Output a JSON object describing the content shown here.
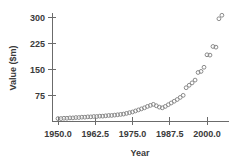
{
  "chart_data": {
    "type": "scatter",
    "title": "",
    "xlabel": "Year",
    "ylabel": "Value ($m)",
    "xlim": [
      1948.0,
      2007.5
    ],
    "ylim": [
      0,
      330
    ],
    "grid": false,
    "legend": null,
    "xticks": [
      "1950.0",
      "1962.5",
      "1975.0",
      "1987.5",
      "2000.0"
    ],
    "xtick_values": [
      1950.0,
      1962.5,
      1975.0,
      1987.5,
      2000.0
    ],
    "yticks": [
      "75",
      "150",
      "225",
      "300"
    ],
    "ytick_values": [
      75,
      150,
      225,
      300
    ],
    "marker": "open-circle",
    "marker_color": "#8a8a8a",
    "x": [
      1950,
      1951,
      1952,
      1953,
      1954,
      1955,
      1956,
      1957,
      1958,
      1959,
      1960,
      1961,
      1962,
      1963,
      1964,
      1965,
      1966,
      1967,
      1968,
      1969,
      1970,
      1971,
      1972,
      1973,
      1974,
      1975,
      1976,
      1977,
      1978,
      1979,
      1980,
      1981,
      1982,
      1983,
      1984,
      1985,
      1986,
      1987,
      1988,
      1989,
      1990,
      1991,
      1992,
      1993,
      1994,
      1995,
      1996,
      1997,
      1998,
      1999,
      2000,
      2001,
      2002,
      2003,
      2004,
      2005
    ],
    "y": [
      7,
      7,
      8,
      8,
      9,
      9,
      10,
      10,
      11,
      11,
      12,
      12,
      13,
      13,
      14,
      14,
      15,
      16,
      16,
      17,
      18,
      19,
      20,
      22,
      24,
      26,
      29,
      32,
      35,
      38,
      42,
      45,
      48,
      44,
      40,
      38,
      42,
      47,
      52,
      57,
      62,
      68,
      74,
      96,
      103,
      110,
      118,
      140,
      143,
      155,
      191,
      190,
      215,
      213,
      295,
      305
    ]
  }
}
